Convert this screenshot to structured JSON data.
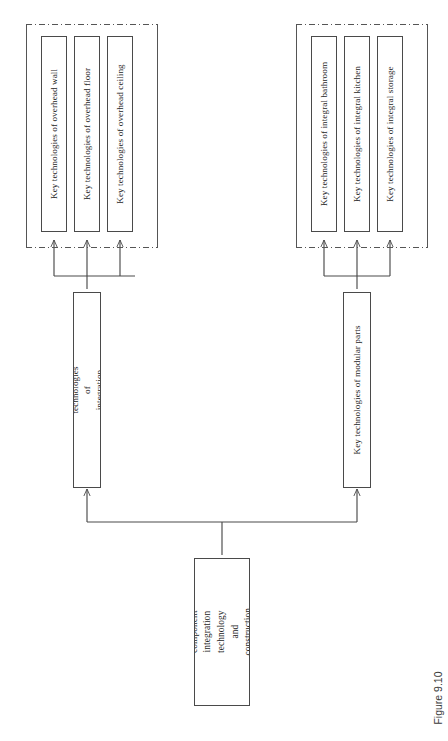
{
  "figure": {
    "caption": "Figure 9.10",
    "orientation": "rotated-90",
    "background_color": "#ffffff",
    "line_color": "#4a4a4a",
    "group_border_style": "dash-dot"
  },
  "root": {
    "label": "INFILL component integration technology and construction method"
  },
  "branches": [
    {
      "id": "integration-components",
      "label": "Key technologies of integration components",
      "group_label": "",
      "leaves": [
        {
          "id": "overhead-wall",
          "label": "Key technologies of overhead wall"
        },
        {
          "id": "overhead-floor",
          "label": "Key technologies of overhead floor"
        },
        {
          "id": "overhead-ceiling",
          "label": "Key technologies of overhead ceiling"
        }
      ]
    },
    {
      "id": "modular-parts",
      "label": "Key technologies of modular parts",
      "group_label": "",
      "leaves": [
        {
          "id": "integral-bathroom",
          "label": "Key technologies of integral bathroom"
        },
        {
          "id": "integral-kitchen",
          "label": "Key technologies of integral kitchen"
        },
        {
          "id": "integral-storage",
          "label": "Key technologies of integral storage"
        }
      ]
    }
  ]
}
